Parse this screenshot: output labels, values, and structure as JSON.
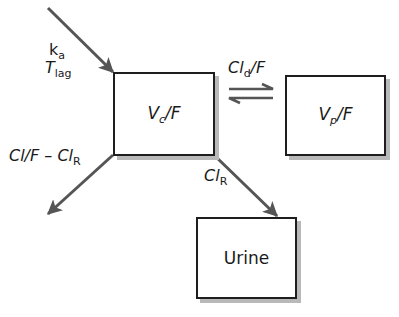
{
  "diagram": {
    "compartments": {
      "central": {
        "main": "V",
        "sub": "c",
        "suffix": "/F"
      },
      "peripheral": {
        "main": "V",
        "sub": "p",
        "suffix": "/F"
      },
      "urine": {
        "label": "Urine"
      }
    },
    "labels": {
      "absorption_rate": {
        "main": "k",
        "sub": "a"
      },
      "lag_time": {
        "main": "T",
        "sub": "lag"
      },
      "distribution_clearance": {
        "main": "Cl",
        "sub": "d",
        "suffix": "/F"
      },
      "nonrenal_clearance": {
        "main": "Cl/F – Cl",
        "sub": "R"
      },
      "renal_clearance": {
        "main": "Cl",
        "sub": "R"
      }
    },
    "colors": {
      "arrow": "#555555",
      "box_border": "#1e1e1e",
      "box_shadow": "#b9b9b9"
    }
  }
}
